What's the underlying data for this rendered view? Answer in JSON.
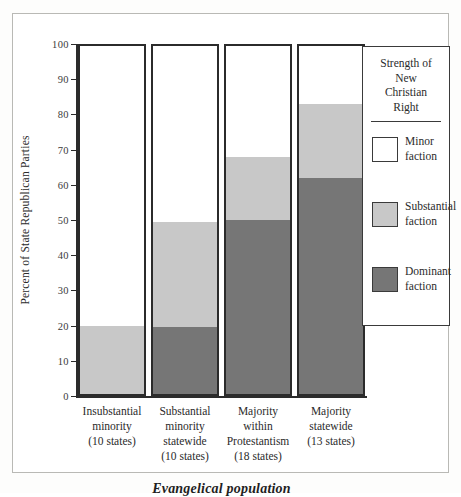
{
  "chart_data": {
    "type": "bar",
    "subtype": "stacked-bar",
    "title": "",
    "xlabel": "Evangelical population",
    "ylabel": "Percent of State Republican Parties",
    "ylim": [
      0,
      100
    ],
    "yticks": [
      0,
      10,
      20,
      30,
      40,
      50,
      60,
      70,
      80,
      90,
      100
    ],
    "ytick_labels": [
      "0",
      "10",
      "20",
      "30",
      "40",
      "50",
      "60",
      "70",
      "80",
      "90",
      "100"
    ],
    "grid": false,
    "legend_position": "right",
    "categories": [
      "Insubstantial minority (10 states)",
      "Substantial minority statewide (10 states)",
      "Majority within Protestantism (18 states)",
      "Majority statewide (13 states)"
    ],
    "category_lines": [
      [
        "Insubstantial",
        "minority",
        "(10 states)"
      ],
      [
        "Substantial",
        "minority",
        "statewide",
        "(10 states)"
      ],
      [
        "Majority",
        "within",
        "Protestantism",
        "(18 states)"
      ],
      [
        "Majority",
        "statewide",
        "(13 states)"
      ]
    ],
    "series": [
      {
        "name": "Dominant faction",
        "color": "#767676",
        "values": [
          0,
          19.5,
          50,
          62
        ]
      },
      {
        "name": "Substantial faction",
        "color": "#c8c8c8",
        "values": [
          20,
          30,
          18,
          21
        ]
      },
      {
        "name": "Minor faction",
        "color": "#ffffff",
        "values": [
          80,
          50.5,
          32,
          17
        ]
      }
    ],
    "cumulative_boundaries": [
      {
        "category": "Insubstantial minority",
        "dominant_top": 0,
        "substantial_top": 20
      },
      {
        "category": "Substantial minority statewide",
        "dominant_top": 19.5,
        "substantial_top": 49.5
      },
      {
        "category": "Majority within Protestantism",
        "dominant_top": 50,
        "substantial_top": 68
      },
      {
        "category": "Majority statewide",
        "dominant_top": 62,
        "substantial_top": 83
      }
    ]
  },
  "legend": {
    "title_lines": [
      "Strength of",
      "New",
      "Christian",
      "Right"
    ],
    "entries": [
      {
        "label_lines": [
          "Minor",
          "faction"
        ],
        "color": "#ffffff"
      },
      {
        "label_lines": [
          "Substantial",
          "faction"
        ],
        "color": "#c8c8c8"
      },
      {
        "label_lines": [
          "Dominant",
          "faction"
        ],
        "color": "#767676"
      }
    ]
  },
  "colors": {
    "minor": "#ffffff",
    "substantial": "#c8c8c8",
    "dominant": "#767676",
    "axis": "#2b2b2b",
    "frame": "#b9b9b5",
    "background": "#ffffff"
  }
}
